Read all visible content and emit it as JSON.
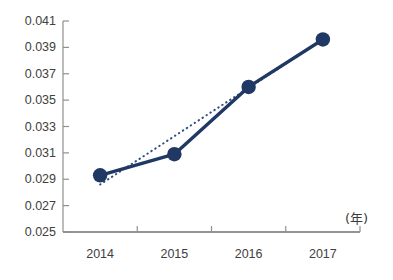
{
  "chart_data": {
    "type": "line",
    "title": "",
    "subtitle": "",
    "xlabel": "(年)",
    "ylabel": "",
    "categories": [
      "2014",
      "2015",
      "2016",
      "2017"
    ],
    "x": [
      2014,
      2015,
      2016,
      2017
    ],
    "ylim": [
      0.025,
      0.041
    ],
    "yticks": [
      "0.041",
      "0.039",
      "0.037",
      "0.035",
      "0.033",
      "0.031",
      "0.029",
      "0.027",
      "0.025"
    ],
    "ytick_values": [
      0.041,
      0.039,
      0.037,
      0.035,
      0.033,
      0.031,
      0.029,
      0.027,
      0.025
    ],
    "grid": false,
    "legend": "none",
    "series": [
      {
        "name": "data",
        "style": "solid-line-with-markers",
        "color": "#1f3864",
        "values": [
          0.0293,
          0.0309,
          0.036,
          0.0396
        ]
      },
      {
        "name": "trendline",
        "style": "dotted-line",
        "color": "#2f4f7f",
        "values": [
          0.0286,
          0.0323,
          0.0359,
          0.0396
        ]
      }
    ],
    "annotations": []
  },
  "colors": {
    "series_line": "#1f3864",
    "marker_fill": "#1f3864",
    "trendline": "#2f4f7f",
    "axis": "#808080",
    "tick_label": "#404040",
    "background": "#ffffff"
  }
}
